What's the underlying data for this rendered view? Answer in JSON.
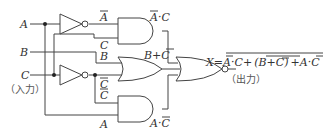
{
  "diagram": {
    "type": "logic-circuit",
    "inputs": [
      {
        "name": "A",
        "label": "A"
      },
      {
        "name": "B",
        "label": "B"
      },
      {
        "name": "C",
        "label": "C",
        "note": "（入力）"
      }
    ],
    "output": {
      "name": "X",
      "note": "（出力）"
    },
    "signal_labels": {
      "not_a": "A",
      "c_top": "C",
      "b_or": "B",
      "not_c_or": "C",
      "not_c_and": "C",
      "a_bottom": "A",
      "and1_out": "A·C",
      "or_out": "B+C",
      "and2_out": "A·C"
    },
    "equation": {
      "lhs": "X",
      "eq": "=",
      "term1_a": "A",
      "term1_rest": "·C",
      "plus1": "+",
      "term2_open": "(B+",
      "term2_c": "C",
      "term2_close": ")",
      "plus2": "+",
      "term3_a": "A·",
      "term3_c": "C"
    },
    "gates": [
      {
        "id": "not-a",
        "type": "NOT",
        "input": "A",
        "output": "Ā"
      },
      {
        "id": "not-c",
        "type": "NOT",
        "input": "C",
        "output": "C̄"
      },
      {
        "id": "and1",
        "type": "AND",
        "inputs": [
          "Ā",
          "C"
        ],
        "output": "Ā·C"
      },
      {
        "id": "or1",
        "type": "OR",
        "inputs": [
          "B",
          "C̄"
        ],
        "output": "B+C̄"
      },
      {
        "id": "and2",
        "type": "AND",
        "inputs": [
          "C̄",
          "A"
        ],
        "output": "A·C̄"
      },
      {
        "id": "nor1",
        "type": "NOR",
        "inputs": [
          "Ā·C",
          "B+C̄",
          "A·C̄"
        ],
        "output": "X"
      }
    ]
  }
}
